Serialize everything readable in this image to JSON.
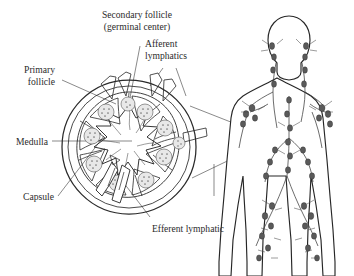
{
  "figure": {
    "background_color": "#ffffff",
    "ink_color": "#2a2a2a",
    "label_color": "#2b2b2b"
  },
  "labels": {
    "secondary_follicle_line1": "Secondary follicle",
    "secondary_follicle_line2": "(germinal center)",
    "afferent_line1": "Afferent",
    "afferent_line2": "lymphatics",
    "primary_line1": "Primary",
    "primary_line2": "follicle",
    "medulla": "Medulla",
    "capsule": "Capsule",
    "efferent": "Efferent lymphatic"
  },
  "diagram": {
    "node_section_name": "lymph-node-cross-section",
    "body_figure_name": "human-lymphatic-system-figure",
    "follicle_count": 10,
    "afferent_vessel_count": 4,
    "efferent_vessel_count": 1
  }
}
